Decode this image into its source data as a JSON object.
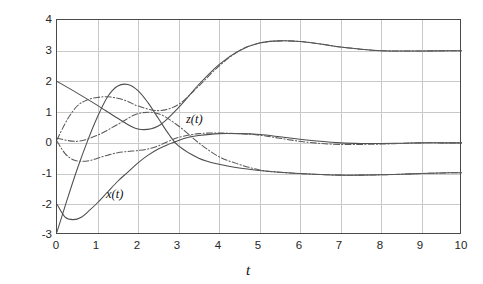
{
  "chart_data": {
    "type": "line",
    "title": "",
    "xlabel": "t",
    "ylabel": "x(t) and z(t)",
    "xlim": [
      0,
      10
    ],
    "ylim": [
      -3,
      4
    ],
    "xticks": [
      "0",
      "1",
      "2",
      "3",
      "4",
      "5",
      "6",
      "7",
      "8",
      "9",
      "10"
    ],
    "yticks": [
      "4",
      "3",
      "2",
      "1",
      "0",
      "-1",
      "-2",
      "-3"
    ],
    "grid": true,
    "legend_position": "inline-annotations",
    "annotations": [
      {
        "text": "z(t)",
        "x": 3.2,
        "y": 0.95
      },
      {
        "text": "x(t)",
        "x": 1.25,
        "y": -1.55
      }
    ],
    "series": [
      {
        "name": "x(t) solid A",
        "label": "x(t)",
        "style": "solid",
        "color": "#4d4d4d",
        "x": [
          0,
          0.2,
          0.4,
          0.6,
          0.8,
          1.0,
          1.25,
          1.5,
          1.75,
          2.0,
          2.25,
          2.5,
          2.75,
          3.0,
          3.25,
          3.5,
          4.0,
          4.5,
          5.0,
          5.5,
          6.0,
          6.5,
          7.0,
          7.5,
          8.0,
          8.5,
          9.0,
          9.5,
          10.0
        ],
        "y": [
          -2.0,
          -2.42,
          -2.5,
          -2.42,
          -2.2,
          -1.95,
          -1.6,
          -1.25,
          -0.95,
          -0.65,
          -0.4,
          -0.2,
          -0.05,
          0.08,
          0.18,
          0.24,
          0.3,
          0.3,
          0.27,
          0.2,
          0.12,
          0.05,
          0.0,
          -0.02,
          -0.02,
          -0.01,
          0.0,
          0.0,
          0.0
        ],
        "x_pixel_hint": "rises from -2 dipping to -2.5 near t=0.4, crosses 0 near t=2.9, peaks ~0.3 at t=4.2, settles to 0"
      },
      {
        "name": "x(t) solid B",
        "label": "x(t)",
        "style": "solid",
        "color": "#4d4d4d",
        "x": [
          0,
          0.25,
          0.5,
          0.75,
          1.0,
          1.25,
          1.5,
          1.75,
          2.0,
          2.25,
          2.5,
          2.75,
          3.0,
          3.5,
          4.0,
          4.5,
          5.0,
          5.5,
          6.0,
          6.5,
          7.0,
          7.5,
          8.0,
          8.5,
          9.0,
          9.5,
          10.0
        ],
        "y": [
          -2.9,
          -1.85,
          -0.85,
          0.05,
          0.85,
          1.5,
          1.85,
          1.9,
          1.7,
          1.3,
          0.8,
          0.3,
          -0.1,
          -0.5,
          -0.7,
          -0.82,
          -0.9,
          -0.96,
          -1.0,
          -1.03,
          -1.05,
          -1.05,
          -1.04,
          -1.02,
          -1.0,
          -0.98,
          -0.97
        ],
        "x_pixel_hint": "steep rise from -2.9, peaks ~1.9 near t=1.7, falls and settles near -1.0"
      },
      {
        "name": "z(t) solid rising",
        "label": "z(t)",
        "style": "solid",
        "color": "#4d4d4d",
        "x": [
          0,
          0.5,
          1.0,
          1.5,
          2.0,
          2.5,
          3.0,
          3.5,
          4.0,
          4.5,
          5.0,
          5.5,
          6.0,
          6.5,
          7.0,
          7.5,
          8.0,
          8.5,
          9.0,
          9.5,
          10.0
        ],
        "y": [
          2.0,
          1.62,
          1.22,
          0.8,
          0.45,
          0.55,
          1.15,
          1.9,
          2.55,
          3.0,
          3.25,
          3.32,
          3.3,
          3.22,
          3.12,
          3.05,
          3.0,
          2.99,
          2.99,
          3.0,
          3.0
        ],
        "x_pixel_hint": "starts at 2, dips to ~0.45 at t=2.1, rises to peak 3.32 at t=5.6, settles at 3.0"
      },
      {
        "name": "z(t) dash-dot rising",
        "label": "z(t)",
        "style": "dashdot",
        "color": "#5a5a5a",
        "x": [
          0,
          0.25,
          0.5,
          0.75,
          1.0,
          1.25,
          1.5,
          1.75,
          2.0,
          2.5,
          3.0,
          3.5,
          4.0,
          4.5,
          5.0,
          5.5,
          6.0,
          6.5,
          7.0,
          7.5,
          8.0,
          9.0,
          10.0
        ],
        "y": [
          0.1,
          0.75,
          1.2,
          1.4,
          1.48,
          1.5,
          1.45,
          1.35,
          1.2,
          1.05,
          1.25,
          1.85,
          2.5,
          3.0,
          3.25,
          3.32,
          3.3,
          3.22,
          3.12,
          3.05,
          3.0,
          2.99,
          3.0
        ],
        "x_pixel_hint": "dash-dot hump peaking ~1.5 near t=1.2, merges with solid z(t) rise after t=3.5"
      },
      {
        "name": "z(t) dash-dot low",
        "label": "z(t)",
        "style": "dashdot",
        "color": "#5a5a5a",
        "x": [
          0,
          0.2,
          0.4,
          0.6,
          0.8,
          1.0,
          1.25,
          1.5,
          1.75,
          2.0,
          2.25,
          2.5,
          2.75,
          3.0,
          3.5,
          4.0,
          4.5,
          5.0,
          5.5,
          6.0,
          6.5,
          7.0,
          7.5,
          8.0,
          8.5,
          9.0,
          9.5,
          10.0
        ],
        "y": [
          0.05,
          -0.35,
          -0.55,
          -0.6,
          -0.58,
          -0.5,
          -0.4,
          -0.32,
          -0.28,
          -0.25,
          -0.2,
          -0.1,
          0.05,
          0.18,
          0.3,
          0.32,
          0.3,
          0.25,
          0.15,
          0.05,
          -0.02,
          -0.05,
          -0.05,
          -0.04,
          -0.02,
          0.0,
          0.0,
          0.0
        ],
        "x_pixel_hint": "dash-dot dipping to -0.6 near t=0.6, rises to ~0.3 around t=4, settles near 0"
      },
      {
        "name": "x(t) dash-dot falling",
        "label": "x(t)",
        "style": "dashdot",
        "color": "#5a5a5a",
        "x": [
          0,
          0.5,
          1.0,
          1.5,
          2.0,
          2.5,
          3.0,
          3.5,
          4.0,
          4.5,
          5.0,
          5.5,
          6.0,
          6.5,
          7.0,
          7.5,
          8.0,
          8.5,
          9.0,
          9.5,
          10.0
        ],
        "y": [
          0.15,
          0.05,
          0.25,
          0.6,
          0.95,
          0.95,
          0.55,
          0.0,
          -0.45,
          -0.7,
          -0.88,
          -0.96,
          -1.0,
          -1.03,
          -1.05,
          -1.05,
          -1.04,
          -1.02,
          -1.0,
          -0.98,
          -0.97
        ],
        "x_pixel_hint": "dash-dot hump peaking ~0.95 near t=2.2, descends to settle near -1.0"
      }
    ]
  },
  "axes": {
    "x_title": "t",
    "y_title_parts": {
      "x_of_t": "x(t)",
      "conj": " and ",
      "z_of_t": "z(t)"
    },
    "y_title_full": "x(t) and z(t)"
  }
}
